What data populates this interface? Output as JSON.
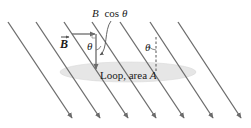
{
  "diagram": {
    "labels": {
      "vector_b": "B",
      "component": "B cos θ",
      "component_b": "B",
      "component_cos": "cos",
      "theta": "θ",
      "theta_right": "θ",
      "loop": "Loop, area",
      "area_symbol": "A"
    },
    "field_lines": {
      "count": 7,
      "start_y": 22,
      "end_y": 118,
      "start_x": [
        8,
        36,
        64,
        92,
        120,
        150,
        178
      ],
      "dx": 64,
      "color": "#6b6b6b"
    },
    "loop": {
      "cx": 128,
      "cy": 72,
      "rx": 68,
      "ry": 10,
      "fill": "#e6e6e6"
    },
    "colors": {
      "line": "#6b6b6b",
      "text": "#1a1a1a",
      "loop_fill": "#e6e6e6"
    }
  }
}
